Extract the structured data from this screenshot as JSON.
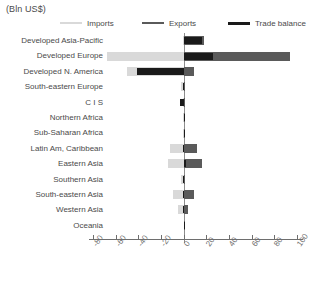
{
  "unit_label": "(Bln US$)",
  "legend": [
    {
      "name": "imports",
      "label": "Imports",
      "color": "#d9d9d9"
    },
    {
      "name": "exports",
      "label": "Exports",
      "color": "#5a5a5a"
    },
    {
      "name": "trade-balance",
      "label": "Trade balance",
      "color": "#1a1a1a"
    }
  ],
  "chart_data": {
    "type": "bar",
    "title": "",
    "subtitle": "",
    "xlabel": "",
    "ylabel": "",
    "unit": "(Bln US$)",
    "orientation": "horizontal",
    "grid": false,
    "legend_position": "top",
    "xlim": [
      -80,
      100
    ],
    "xticks": [
      -80,
      -60,
      -40,
      -20,
      0,
      20,
      40,
      60,
      80,
      100
    ],
    "xticklabels": [
      "-80",
      "-60",
      "-40",
      "-20",
      "0",
      "20",
      "40",
      "60",
      "80",
      "100"
    ],
    "categories": [
      "Developed Asia-Pacific",
      "Developed Europe",
      "Developed N. America",
      "South-eastern Europe",
      "C I S",
      "Northern Africa",
      "Sub-Saharan Africa",
      "Latin Am, Caribbean",
      "Eastern Asia",
      "Southern Asia",
      "South-eastern Asia",
      "Western Asia",
      "Oceania"
    ],
    "series": [
      {
        "name": "Imports",
        "color": "#d9d9d9",
        "values": [
          -1,
          -68,
          -50,
          -2,
          -1,
          -1,
          -1,
          -12,
          -14,
          -2,
          -9,
          -5,
          0
        ]
      },
      {
        "name": "Exports",
        "color": "#5a5a5a",
        "values": [
          18,
          94,
          9,
          1,
          1,
          1,
          1,
          12,
          16,
          1,
          9,
          4,
          0
        ]
      },
      {
        "name": "Trade balance",
        "color": "#1a1a1a",
        "values": [
          16,
          26,
          -41,
          -1,
          -3,
          0,
          0,
          -1,
          2,
          -1,
          -1,
          -1,
          0
        ]
      }
    ]
  }
}
